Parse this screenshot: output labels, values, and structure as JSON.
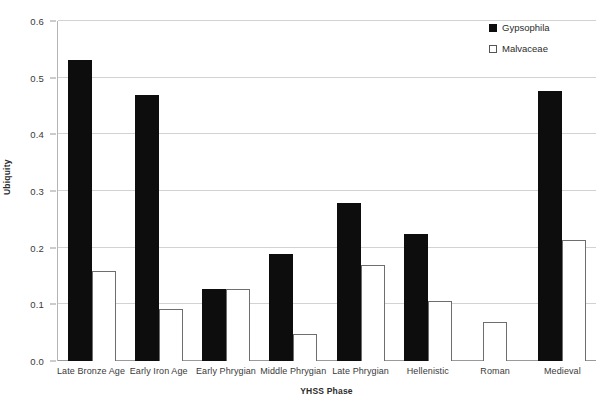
{
  "chart_data": {
    "type": "bar",
    "title": "",
    "xlabel": "YHSS Phase",
    "ylabel": "Ubiquity",
    "ylim": [
      0,
      0.6
    ],
    "ytick_values": [
      0.6,
      0.5,
      0.4,
      0.3,
      0.2,
      0.1,
      0.0
    ],
    "ytick_labels": [
      "0.6",
      "0.5",
      "0.4",
      "0.3",
      "0.2",
      "0.1",
      "0.0"
    ],
    "grid": true,
    "legend_position": "top-right",
    "categories": [
      "Late Bronze Age",
      "Early Iron Age",
      "Early Phrygian",
      "Middle Phrygian",
      "Late Phrygian",
      "Hellenistic",
      "Roman",
      "Medieval"
    ],
    "series": [
      {
        "name": "Gypsophila",
        "color": "#0d0d0d",
        "style": "filled",
        "values": [
          0.532,
          0.47,
          0.127,
          0.189,
          0.279,
          0.225,
          0.0,
          0.477
        ]
      },
      {
        "name": "Malvaceae",
        "color": "#ffffff",
        "style": "hollow",
        "values": [
          0.158,
          0.092,
          0.127,
          0.048,
          0.169,
          0.106,
          0.069,
          0.213
        ]
      }
    ]
  },
  "legend": {
    "entries": [
      {
        "label": "Gypsophila",
        "swatch": "filled-square-icon"
      },
      {
        "label": "Malvaceae",
        "swatch": "hollow-square-icon"
      }
    ]
  }
}
